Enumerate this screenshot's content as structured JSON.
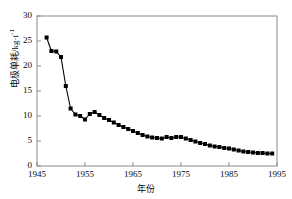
{
  "chart_data": {
    "type": "line",
    "title": "",
    "xlabel": "年份",
    "ylabel": "电极单耗/kg·t⁻¹",
    "ylabel_main": "电极单耗/kg·t",
    "ylabel_exponent": "-1",
    "xlim": [
      1945,
      1995
    ],
    "ylim": [
      0,
      30
    ],
    "grid": false,
    "legend": null,
    "xticks": [
      1945,
      1955,
      1965,
      1975,
      1985,
      1995
    ],
    "yticks": [
      0,
      5,
      10,
      15,
      20,
      25,
      30
    ],
    "xtick_labels": [
      "1945",
      "1955",
      "1965",
      "1975",
      "1985",
      "1995"
    ],
    "ytick_labels": [
      "0",
      "5",
      "10",
      "15",
      "20",
      "25",
      "30"
    ],
    "marker": "filled-square",
    "marker_color": "#000000",
    "line_color": "#000000",
    "series": [
      {
        "name": "电极单耗",
        "x": [
          1947,
          1948,
          1949,
          1950,
          1951,
          1952,
          1953,
          1954,
          1955,
          1956,
          1957,
          1958,
          1959,
          1960,
          1961,
          1962,
          1963,
          1964,
          1965,
          1966,
          1967,
          1968,
          1969,
          1970,
          1971,
          1972,
          1973,
          1974,
          1975,
          1976,
          1977,
          1978,
          1979,
          1980,
          1981,
          1982,
          1983,
          1984,
          1985,
          1986,
          1987,
          1988,
          1989,
          1990,
          1991,
          1992,
          1993,
          1994
        ],
        "values": [
          25.7,
          23.0,
          22.9,
          21.8,
          16.0,
          11.5,
          10.3,
          10.0,
          9.3,
          10.4,
          10.8,
          10.2,
          9.6,
          9.2,
          8.7,
          8.2,
          7.8,
          7.4,
          7.0,
          6.6,
          6.2,
          5.9,
          5.7,
          5.6,
          5.5,
          5.8,
          5.6,
          5.8,
          5.8,
          5.5,
          5.2,
          4.9,
          4.6,
          4.4,
          4.1,
          3.9,
          3.8,
          3.6,
          3.5,
          3.3,
          3.1,
          2.9,
          2.8,
          2.7,
          2.6,
          2.6,
          2.5,
          2.5
        ]
      }
    ]
  },
  "axes": {
    "frame_color": "#8a8a8a"
  }
}
